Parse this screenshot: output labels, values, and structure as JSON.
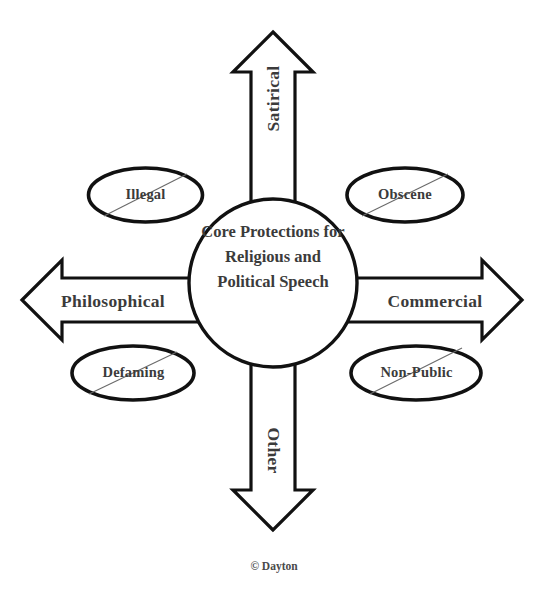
{
  "diagram": {
    "title": "Core Protections for Religious and Political Speech",
    "core": {
      "text": "Core Protections for Religious and Political Speech"
    },
    "arrows": [
      {
        "id": "up",
        "label": "Satirical",
        "direction": "up"
      },
      {
        "id": "right",
        "label": "Commercial",
        "direction": "right"
      },
      {
        "id": "down",
        "label": "Other",
        "direction": "down"
      },
      {
        "id": "left",
        "label": "Philosophical",
        "direction": "left"
      }
    ],
    "excluded": [
      {
        "id": "illegal",
        "label": "Illegal",
        "position": "top-left"
      },
      {
        "id": "obscene",
        "label": "Obscene",
        "position": "top-right"
      },
      {
        "id": "defaming",
        "label": "Defaming",
        "position": "bottom-left"
      },
      {
        "id": "non-public",
        "label": "Non-Public",
        "position": "bottom-right"
      }
    ],
    "footer": {
      "credit": "© Dayton"
    },
    "colors": {
      "background": "#ffffff",
      "stroke": "#111111",
      "text": "#3b3b3b",
      "strike": "#6a6a6a"
    }
  }
}
